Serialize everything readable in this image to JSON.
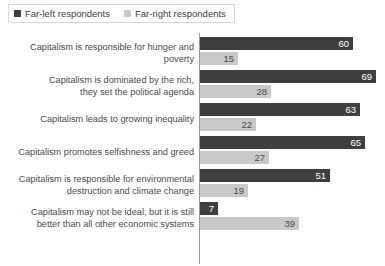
{
  "legend": {
    "position": "top-left",
    "entries": [
      {
        "label": "Far-left respondents",
        "color": "#3f3f3f",
        "swatch_name": "legend-swatch-far-left"
      },
      {
        "label": "Far-right respondents",
        "color": "#c9c9c9",
        "swatch_name": "legend-swatch-far-right"
      }
    ]
  },
  "chart_data": {
    "type": "bar",
    "orientation": "horizontal",
    "title": "",
    "subtitle": "",
    "xlabel": "",
    "ylabel": "",
    "xlim": [
      0,
      72
    ],
    "grid": false,
    "axis_ticks_visible": false,
    "legend_position": "top-left",
    "value_suffix": "",
    "categories": [
      "Capitalism is responsible for hunger and poverty",
      "Capitalism is dominated by the rich, they set the political agenda",
      "Capitalism leads to growing inequality",
      "Capitalism promotes selfishness and greed",
      "Capitalism is responsible for environmental destruction and climate change",
      "Capitalism may not be ideal, but it is still better than all other economic systems"
    ],
    "category_lines": [
      [
        "Capitalism is responsible for hunger and poverty"
      ],
      [
        "Capitalism is dominated by the rich,",
        "they set the political agenda"
      ],
      [
        "Capitalism leads to growing inequality"
      ],
      [
        "Capitalism promotes selfishness and greed"
      ],
      [
        "Capitalism is responsible for environmental",
        "destruction and climate change"
      ],
      [
        "Capitalism may not be ideal, but it is still",
        "better than all other economic systems"
      ]
    ],
    "series": [
      {
        "name": "Far-left respondents",
        "color": "#3f3f3f",
        "values": [
          60,
          69,
          63,
          65,
          51,
          7
        ]
      },
      {
        "name": "Far-right respondents",
        "color": "#c9c9c9",
        "values": [
          15,
          28,
          22,
          27,
          19,
          39
        ]
      }
    ]
  }
}
